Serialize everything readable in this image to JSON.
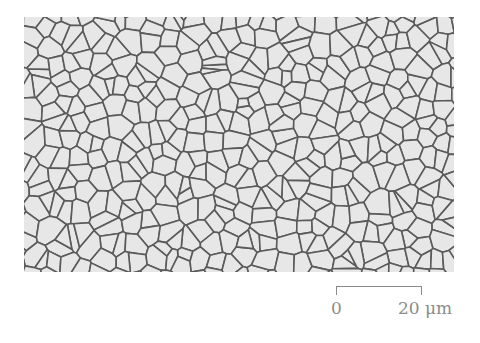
{
  "figure": {
    "type": "optical micrograph",
    "colors": {
      "grain_fill": "#e6e6e6",
      "boundary": "#5a5a5a",
      "scale_text": "#8c8c8c"
    }
  },
  "scale_bar": {
    "start_label": "0",
    "end_label": "20 μm",
    "length_value": 20,
    "unit": "μm"
  }
}
